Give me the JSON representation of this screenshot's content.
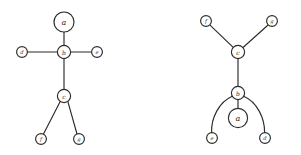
{
  "figure": {
    "background_color": "#ffffff",
    "stroke_color": "#2b2b2b",
    "node_fill_color": "#ffffff"
  },
  "chart_data": {
    "type": "diagram",
    "title": "",
    "vertices": [
      "a",
      "b",
      "c",
      "d",
      "e",
      "f",
      "g"
    ],
    "edges": [
      [
        "a",
        "b"
      ],
      [
        "b",
        "d"
      ],
      [
        "b",
        "e"
      ],
      [
        "b",
        "c"
      ],
      [
        "c",
        "f"
      ],
      [
        "c",
        "g"
      ]
    ]
  },
  "diagrams": [
    {
      "name": "left-drawing",
      "nodes": [
        {
          "id": "a",
          "label": "a",
          "cx": 64,
          "cy": 22,
          "r": 10.0,
          "size": "lg"
        },
        {
          "id": "b",
          "label": "b",
          "cx": 64,
          "cy": 52,
          "r": 6.6,
          "size": "md"
        },
        {
          "id": "d",
          "label": "d",
          "cx": 22,
          "cy": 52,
          "r": 5.4,
          "size": "sm"
        },
        {
          "id": "e",
          "label": "e",
          "cx": 97,
          "cy": 52,
          "r": 5.4,
          "size": "sm"
        },
        {
          "id": "c",
          "label": "c",
          "cx": 64,
          "cy": 96,
          "r": 6.6,
          "size": "md"
        },
        {
          "id": "f",
          "label": "f",
          "cx": 41,
          "cy": 139,
          "r": 5.4,
          "size": "sm"
        },
        {
          "id": "g",
          "label": "g",
          "cx": 79,
          "cy": 139,
          "r": 5.4,
          "size": "sm"
        }
      ],
      "edges": [
        {
          "from": "a",
          "to": "b",
          "kind": "line",
          "d": "M 64 32 L 64 45.4"
        },
        {
          "from": "d",
          "to": "b",
          "kind": "line",
          "d": "M 27.4 52 L 57.4 52"
        },
        {
          "from": "b",
          "to": "e",
          "kind": "line",
          "d": "M 70.6 52 L 91.6 52"
        },
        {
          "from": "b",
          "to": "c",
          "kind": "line",
          "d": "M 64 58.6 L 64 89.4"
        },
        {
          "from": "c",
          "to": "f",
          "kind": "line",
          "d": "M 60.2 101.4 L 43.5 134"
        },
        {
          "from": "c",
          "to": "g",
          "kind": "line",
          "d": "M 67.8 101.4 L 77.0 134"
        }
      ]
    },
    {
      "name": "right-drawing",
      "nodes": [
        {
          "id": "f",
          "label": "f",
          "cx": 206,
          "cy": 21,
          "r": 5.4,
          "size": "sm"
        },
        {
          "id": "g",
          "label": "g",
          "cx": 272,
          "cy": 21,
          "r": 5.4,
          "size": "sm"
        },
        {
          "id": "c",
          "label": "c",
          "cx": 238,
          "cy": 52,
          "r": 6.6,
          "size": "md"
        },
        {
          "id": "b",
          "label": "b",
          "cx": 238,
          "cy": 93,
          "r": 6.6,
          "size": "md"
        },
        {
          "id": "a",
          "label": "a",
          "cx": 238,
          "cy": 118,
          "r": 9.6,
          "size": "lg"
        },
        {
          "id": "e",
          "label": "e",
          "cx": 212,
          "cy": 138,
          "r": 5.4,
          "size": "sm"
        },
        {
          "id": "d",
          "label": "d",
          "cx": 265,
          "cy": 138,
          "r": 5.4,
          "size": "sm"
        }
      ],
      "edges": [
        {
          "from": "f",
          "to": "c",
          "kind": "line",
          "d": "M 210.3 25.3 L 234.0 48.1"
        },
        {
          "from": "g",
          "to": "c",
          "kind": "line",
          "d": "M 267.8 25.3 L 242.2 48.2"
        },
        {
          "from": "c",
          "to": "b",
          "kind": "line",
          "d": "M 238 58.6 L 238 86.4"
        },
        {
          "from": "b",
          "to": "a",
          "kind": "line",
          "d": "M 238 99.6 L 238 108.4"
        },
        {
          "from": "b",
          "to": "e",
          "kind": "curve",
          "d": "M 232.3 96.3 C 219.0 102.0 211.0 118.0 211.6 132.6"
        },
        {
          "from": "b",
          "to": "d",
          "kind": "curve",
          "d": "M 243.7 96.3 C 257.0 102.0 264.8 118.0 264.6 132.6"
        }
      ]
    }
  ]
}
